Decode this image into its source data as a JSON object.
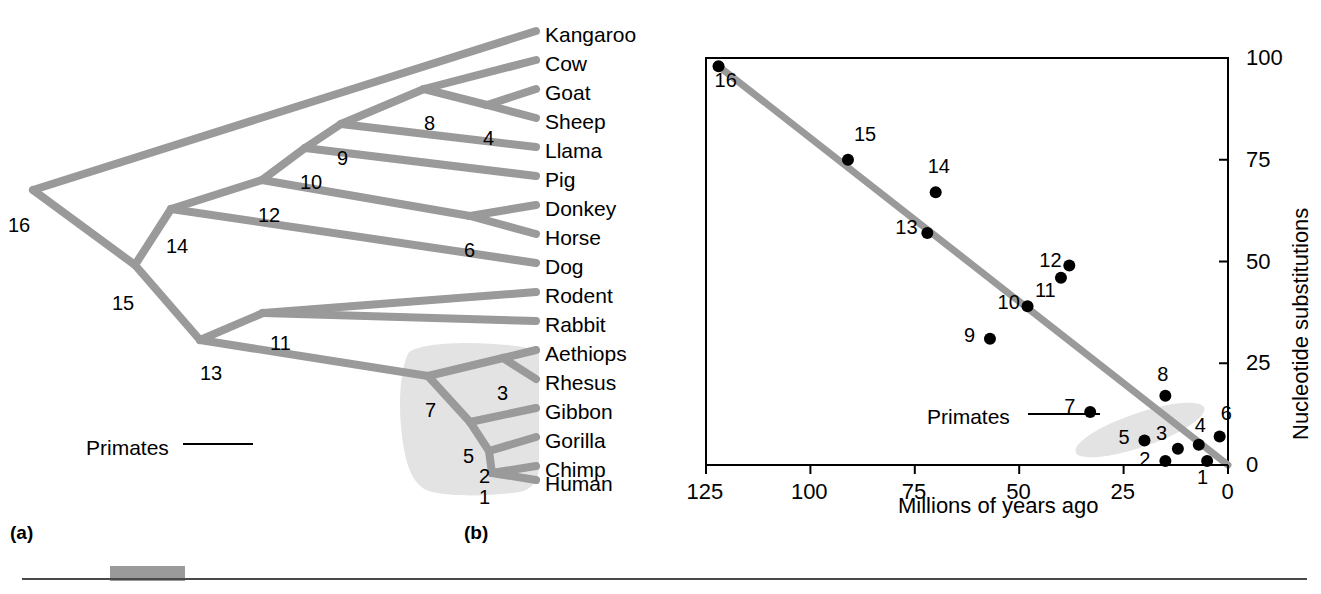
{
  "figure": {
    "panel_a_label": "(a)",
    "panel_b_label": "(b)",
    "branch_color": "#9a9a9a",
    "highlight_color": "#e3e3e3",
    "point_color": "#000000",
    "axis_color": "#000000"
  },
  "tree": {
    "caption_primates": "Primates",
    "tips": [
      {
        "label": "Kangaroo",
        "y": 38
      },
      {
        "label": "Cow",
        "y": 67
      },
      {
        "label": "Goat",
        "y": 96
      },
      {
        "label": "Sheep",
        "y": 125
      },
      {
        "label": "Llama",
        "y": 154
      },
      {
        "label": "Pig",
        "y": 183
      },
      {
        "label": "Donkey",
        "y": 212
      },
      {
        "label": "Horse",
        "y": 241
      },
      {
        "label": "Dog",
        "y": 270
      },
      {
        "label": "Rodent",
        "y": 299
      },
      {
        "label": "Rabbit",
        "y": 328
      },
      {
        "label": "Aethiops",
        "y": 357
      },
      {
        "label": "Rhesus",
        "y": 386
      },
      {
        "label": "Gibbon",
        "y": 415
      },
      {
        "label": "Gorilla",
        "y": 444
      },
      {
        "label": "Chimp",
        "y": 473
      },
      {
        "label": "Human",
        "y": 487
      }
    ],
    "nodes": [
      {
        "id": "16",
        "x": 8,
        "y": 215
      },
      {
        "id": "15",
        "x": 112,
        "y": 293
      },
      {
        "id": "14",
        "x": 166,
        "y": 236
      },
      {
        "id": "13",
        "x": 200,
        "y": 363
      },
      {
        "id": "12",
        "x": 258,
        "y": 205
      },
      {
        "id": "11",
        "x": 270,
        "y": 333
      },
      {
        "id": "10",
        "x": 300,
        "y": 172
      },
      {
        "id": "9",
        "x": 337,
        "y": 148
      },
      {
        "id": "8",
        "x": 424,
        "y": 113
      },
      {
        "id": "7",
        "x": 425,
        "y": 400
      },
      {
        "id": "6",
        "x": 464,
        "y": 240
      },
      {
        "id": "5",
        "x": 463,
        "y": 446
      },
      {
        "id": "4",
        "x": 483,
        "y": 128
      },
      {
        "id": "3",
        "x": 497,
        "y": 383
      },
      {
        "id": "2",
        "x": 479,
        "y": 466
      },
      {
        "id": "1",
        "x": 479,
        "y": 487
      }
    ]
  },
  "chart_data": {
    "type": "scatter",
    "title": "",
    "xlabel": "Millions of years ago",
    "ylabel": "Nucleotide substitutions",
    "xlim": [
      125,
      0
    ],
    "ylim": [
      0,
      100
    ],
    "x_reversed": true,
    "xticks": [
      125,
      100,
      75,
      50,
      25,
      0
    ],
    "yticks": [
      0,
      25,
      50,
      75,
      100
    ],
    "y_axis_side": "right",
    "grid": false,
    "legend": null,
    "annotation": "Primates",
    "trendline": {
      "from": [
        122,
        98
      ],
      "to": [
        0,
        0
      ]
    },
    "points": [
      {
        "label": "1",
        "x": 5,
        "y": 1
      },
      {
        "label": "2",
        "x": 15,
        "y": 1
      },
      {
        "label": "3",
        "x": 12,
        "y": 4
      },
      {
        "label": "4",
        "x": 7,
        "y": 5
      },
      {
        "label": "5",
        "x": 20,
        "y": 6
      },
      {
        "label": "6",
        "x": 2,
        "y": 7
      },
      {
        "label": "7",
        "x": 33,
        "y": 13
      },
      {
        "label": "8",
        "x": 15,
        "y": 17
      },
      {
        "label": "9",
        "x": 57,
        "y": 31
      },
      {
        "label": "10",
        "x": 48,
        "y": 39
      },
      {
        "label": "11",
        "x": 40,
        "y": 46
      },
      {
        "label": "12",
        "x": 38,
        "y": 49
      },
      {
        "label": "13",
        "x": 72,
        "y": 57
      },
      {
        "label": "14",
        "x": 70,
        "y": 67
      },
      {
        "label": "15",
        "x": 91,
        "y": 75
      },
      {
        "label": "16",
        "x": 122,
        "y": 98
      }
    ]
  }
}
